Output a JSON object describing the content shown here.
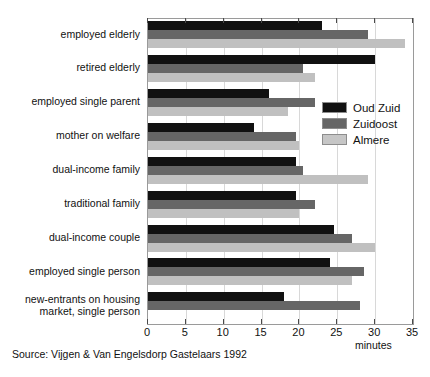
{
  "chart_data": {
    "type": "bar",
    "orientation": "horizontal",
    "title": "",
    "subtitle": "",
    "xlabel": "minutes",
    "ylabel": "",
    "xlim": [
      0,
      35
    ],
    "xticks": [
      0,
      5,
      10,
      15,
      20,
      25,
      30,
      35
    ],
    "xticklabels": [
      "0",
      "5",
      "10",
      "15",
      "20",
      "25",
      "30",
      "35"
    ],
    "grid": true,
    "legend_position": "inside-right",
    "categories": [
      "employed elderly",
      "retired elderly",
      "employed single parent",
      "mother on welfare",
      "dual-income family",
      "traditional family",
      "dual-income couple",
      "employed single person",
      "new-entrants on housing market, single person"
    ],
    "series": [
      {
        "name": "Oud Zuid",
        "color": "#111111",
        "values": [
          23.0,
          30.0,
          16.0,
          14.0,
          19.5,
          19.5,
          24.5,
          24.0,
          18.0
        ]
      },
      {
        "name": "Zuidoost",
        "color": "#666666",
        "values": [
          29.0,
          20.5,
          22.0,
          19.5,
          20.5,
          22.0,
          27.0,
          28.5,
          28.0
        ]
      },
      {
        "name": "Almere",
        "color": "#c0c0c0",
        "values": [
          34.0,
          22.0,
          18.5,
          20.0,
          29.0,
          20.0,
          30.0,
          27.0,
          null
        ]
      }
    ],
    "annotations": [
      "Source: Vijgen & Van Engelsdorp Gastelaars 1992"
    ]
  },
  "category_label_lines": [
    [
      "employed elderly"
    ],
    [
      "retired elderly"
    ],
    [
      "employed single parent"
    ],
    [
      "mother on welfare"
    ],
    [
      "dual-income family"
    ],
    [
      "traditional family"
    ],
    [
      "dual-income couple"
    ],
    [
      "employed single person"
    ],
    [
      "new-entrants on housing",
      "market, single person"
    ]
  ],
  "legend": {
    "items": [
      {
        "label": "Oud Zuid"
      },
      {
        "label": "Zuidoost"
      },
      {
        "label": "Almere"
      }
    ]
  },
  "axis": {
    "title": "minutes"
  },
  "source": {
    "text": "Source: Vijgen & Van Engelsdorp Gastelaars 1992"
  }
}
